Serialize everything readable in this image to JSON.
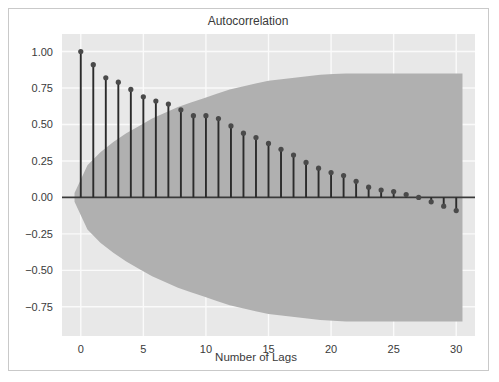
{
  "chart_data": {
    "type": "stem",
    "title": "Autocorrelation",
    "xlabel": "Number of Lags",
    "ylabel": "",
    "x": [
      0,
      1,
      2,
      3,
      4,
      5,
      6,
      7,
      8,
      9,
      10,
      11,
      12,
      13,
      14,
      15,
      16,
      17,
      18,
      19,
      20,
      21,
      22,
      23,
      24,
      25,
      26,
      27,
      28,
      29,
      30
    ],
    "values": [
      1.0,
      0.91,
      0.82,
      0.79,
      0.74,
      0.69,
      0.66,
      0.64,
      0.6,
      0.56,
      0.56,
      0.54,
      0.49,
      0.44,
      0.41,
      0.37,
      0.33,
      0.29,
      0.24,
      0.2,
      0.17,
      0.15,
      0.11,
      0.07,
      0.05,
      0.04,
      0.02,
      0.0,
      -0.03,
      -0.06,
      -0.09
    ],
    "xlim": [
      -1.5,
      31.5
    ],
    "ylim": [
      -0.95,
      1.12
    ],
    "xticks": [
      0,
      5,
      10,
      15,
      20,
      25,
      30
    ],
    "xtick_labels": [
      "0",
      "5",
      "10",
      "15",
      "20",
      "25",
      "30"
    ],
    "yticks": [
      1.0,
      0.75,
      0.5,
      0.25,
      0.0,
      -0.25,
      -0.5,
      -0.75
    ],
    "ytick_labels": [
      "1.00",
      "0.75",
      "0.50",
      "0.25",
      "0.00",
      "−0.25",
      "−0.50",
      "−0.75"
    ],
    "grid": true,
    "legend": null,
    "confidence_band": {
      "label": "confidence-interval",
      "level": 0.95,
      "x_start": -0.5,
      "x_end": 30.5,
      "upper": [
        0.03,
        0.22,
        0.31,
        0.38,
        0.44,
        0.49,
        0.54,
        0.58,
        0.62,
        0.65,
        0.68,
        0.71,
        0.74,
        0.76,
        0.78,
        0.8,
        0.81,
        0.82,
        0.83,
        0.84,
        0.845,
        0.85,
        0.85,
        0.85,
        0.85,
        0.85,
        0.85,
        0.85,
        0.85,
        0.85,
        0.85
      ],
      "lower": [
        -0.03,
        -0.22,
        -0.31,
        -0.38,
        -0.44,
        -0.49,
        -0.54,
        -0.58,
        -0.62,
        -0.65,
        -0.68,
        -0.71,
        -0.74,
        -0.76,
        -0.78,
        -0.8,
        -0.81,
        -0.82,
        -0.83,
        -0.84,
        -0.845,
        -0.85,
        -0.85,
        -0.85,
        -0.85,
        -0.85,
        -0.85,
        -0.85,
        -0.85,
        -0.85,
        -0.85
      ]
    }
  },
  "colors": {
    "plot_background": "#e8e8e8",
    "band_fill": "#b0b0b0",
    "stem_line": "#2b2b2b",
    "marker": "#4a4a4a",
    "baseline": "#3a3a3a",
    "grid": "#fafafa",
    "text": "#3a3a3a",
    "figure_background": "#ffffff",
    "frame_border": "#c9c9c9"
  }
}
